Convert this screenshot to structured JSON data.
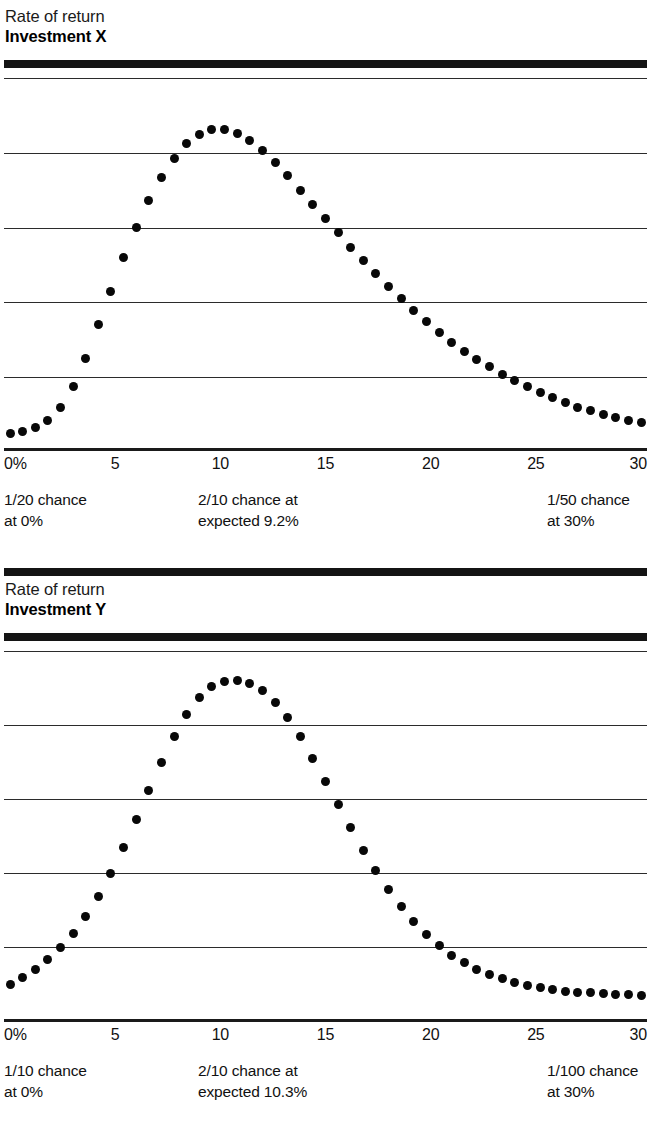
{
  "page": {
    "width": 651,
    "height": 1126,
    "background": "#ffffff",
    "ink": "#111111"
  },
  "charts": [
    {
      "id": "investment-x",
      "header": {
        "line1": "Rate of return",
        "line2": "Investment X"
      },
      "axis": {
        "ticks": [
          "0%",
          "5",
          "10",
          "15",
          "20",
          "25",
          "30"
        ]
      },
      "annotations": [
        {
          "id": "left",
          "text": "1/20 chance\nat 0%"
        },
        {
          "id": "center",
          "text": "2/10 chance at\nexpected 9.2%"
        },
        {
          "id": "right",
          "text": "1/50 chance\nat 30%"
        }
      ]
    },
    {
      "id": "investment-y",
      "header": {
        "line1": "Rate of return",
        "line2": "Investment Y"
      },
      "axis": {
        "ticks": [
          "0%",
          "5",
          "10",
          "15",
          "20",
          "25",
          "30"
        ]
      },
      "annotations": [
        {
          "id": "left",
          "text": "1/10 chance\nat 0%"
        },
        {
          "id": "center",
          "text": "2/10 chance at\nexpected 10.3%"
        },
        {
          "id": "right",
          "text": "1/100 chance\nat 30%"
        }
      ]
    }
  ],
  "chart_data": [
    {
      "type": "scatter",
      "id": "investment-x",
      "title": "Rate of return — Investment X",
      "xlabel": "Rate of return (%)",
      "ylabel": "Probability",
      "xlim": [
        0,
        30
      ],
      "ylim": [
        0,
        1
      ],
      "grid": true,
      "gridlines_y": [
        0.2,
        0.4,
        0.6,
        0.8,
        1.0
      ],
      "xticks": [
        0,
        5,
        10,
        15,
        20,
        25,
        30
      ],
      "xticklabels": [
        "0%",
        "5",
        "10",
        "15",
        "20",
        "25",
        "30"
      ],
      "legend": "none",
      "marker": "filled-circle",
      "annotations": [
        {
          "text": "1/20 chance at 0%",
          "x": 0,
          "probability": 0.05
        },
        {
          "text": "2/10 chance at expected 9.2%",
          "x": 9.2,
          "probability": 0.2
        },
        {
          "text": "1/50 chance at 30%",
          "x": 30,
          "probability": 0.02
        }
      ],
      "expected_value": 9.2,
      "x": [
        0.0,
        0.6,
        1.2,
        1.8,
        2.4,
        3.0,
        3.6,
        4.2,
        4.8,
        5.4,
        6.0,
        6.6,
        7.2,
        7.8,
        8.4,
        9.0,
        9.6,
        10.2,
        10.8,
        11.4,
        12.0,
        12.6,
        13.2,
        13.8,
        14.4,
        15.0,
        15.6,
        16.2,
        16.8,
        17.4,
        18.0,
        18.6,
        19.2,
        19.8,
        20.4,
        21.0,
        21.6,
        22.2,
        22.8,
        23.4,
        24.0,
        24.6,
        25.2,
        25.8,
        26.4,
        27.0,
        27.6,
        28.2,
        28.8,
        29.4,
        30.0
      ],
      "y": [
        0.05,
        0.055,
        0.065,
        0.085,
        0.12,
        0.175,
        0.25,
        0.34,
        0.43,
        0.52,
        0.6,
        0.672,
        0.733,
        0.785,
        0.824,
        0.85,
        0.862,
        0.862,
        0.852,
        0.833,
        0.807,
        0.775,
        0.738,
        0.7,
        0.662,
        0.624,
        0.586,
        0.548,
        0.512,
        0.476,
        0.442,
        0.41,
        0.378,
        0.348,
        0.32,
        0.294,
        0.27,
        0.248,
        0.228,
        0.208,
        0.19,
        0.174,
        0.159,
        0.145,
        0.132,
        0.12,
        0.11,
        0.1,
        0.092,
        0.085,
        0.08
      ]
    },
    {
      "type": "scatter",
      "id": "investment-y",
      "title": "Rate of return — Investment Y",
      "xlabel": "Rate of return (%)",
      "ylabel": "Probability",
      "xlim": [
        0,
        30
      ],
      "ylim": [
        0,
        1
      ],
      "grid": true,
      "gridlines_y": [
        0.2,
        0.4,
        0.6,
        0.8,
        1.0
      ],
      "xticks": [
        0,
        5,
        10,
        15,
        20,
        25,
        30
      ],
      "xticklabels": [
        "0%",
        "5",
        "10",
        "15",
        "20",
        "25",
        "30"
      ],
      "legend": "none",
      "marker": "filled-circle",
      "annotations": [
        {
          "text": "1/10 chance at 0%",
          "x": 0,
          "probability": 0.1
        },
        {
          "text": "2/10 chance at expected 10.3%",
          "x": 10.3,
          "probability": 0.2
        },
        {
          "text": "1/100 chance at 30%",
          "x": 30,
          "probability": 0.01
        }
      ],
      "expected_value": 10.3,
      "x": [
        0.0,
        0.6,
        1.2,
        1.8,
        2.4,
        3.0,
        3.6,
        4.2,
        4.8,
        5.4,
        6.0,
        6.6,
        7.2,
        7.8,
        8.4,
        9.0,
        9.6,
        10.2,
        10.8,
        11.4,
        12.0,
        12.6,
        13.2,
        13.8,
        14.4,
        15.0,
        15.6,
        16.2,
        16.8,
        17.4,
        18.0,
        18.6,
        19.2,
        19.8,
        20.4,
        21.0,
        21.6,
        22.2,
        22.8,
        23.4,
        24.0,
        24.6,
        25.2,
        25.8,
        26.4,
        27.0,
        27.6,
        28.2,
        28.8,
        29.4,
        30.0
      ],
      "y": [
        0.1,
        0.118,
        0.14,
        0.166,
        0.198,
        0.236,
        0.282,
        0.336,
        0.4,
        0.47,
        0.545,
        0.622,
        0.698,
        0.768,
        0.828,
        0.874,
        0.903,
        0.917,
        0.92,
        0.912,
        0.893,
        0.862,
        0.82,
        0.768,
        0.71,
        0.648,
        0.585,
        0.522,
        0.462,
        0.406,
        0.355,
        0.309,
        0.268,
        0.233,
        0.203,
        0.178,
        0.157,
        0.14,
        0.126,
        0.114,
        0.104,
        0.096,
        0.09,
        0.085,
        0.081,
        0.078,
        0.076,
        0.074,
        0.072,
        0.071,
        0.07
      ]
    }
  ]
}
